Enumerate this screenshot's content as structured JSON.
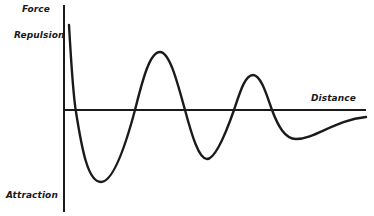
{
  "diagram": {
    "labels": {
      "y_axis_title": "Force",
      "y_positive": "Repulsion",
      "y_negative": "Attraction",
      "x_axis_title": "Distance"
    },
    "colors": {
      "background": "#ffffff",
      "ink": "#1a1a1a"
    },
    "axes": {
      "y_axis": {
        "x": 64,
        "y_top": 5,
        "y_bottom": 212
      },
      "x_axis": {
        "y": 110,
        "x_start": 65,
        "x_end": 366
      }
    },
    "curve": {
      "description": "Damped oscillating force vs. distance curve",
      "path": "M69,25 C71,60 73,95 76,112 C82,150 88,182 101,182 C114,182 127,140 135,110 C143,78 150,52 160,52 C170,52 178,85 185,110 C192,136 199,159 207,159 C216,159 227,130 234,110 C240,92 245,75 253,75 C261,75 267,96 272,110 C278,126 285,139 296,139 C315,139 335,120 366,117"
    }
  },
  "chart_data": {
    "type": "line",
    "title": "",
    "xlabel": "Distance",
    "ylabel": "Force",
    "y_annotations": {
      "positive": "Repulsion",
      "negative": "Attraction"
    },
    "grid": false,
    "series": [
      {
        "name": "Force",
        "x": [
          69,
          76,
          101,
          135,
          160,
          185,
          207,
          234,
          253,
          272,
          296,
          366
        ],
        "y": [
          85,
          0,
          -72,
          0,
          58,
          0,
          -49,
          0,
          35,
          0,
          -29,
          -7
        ]
      }
    ]
  }
}
